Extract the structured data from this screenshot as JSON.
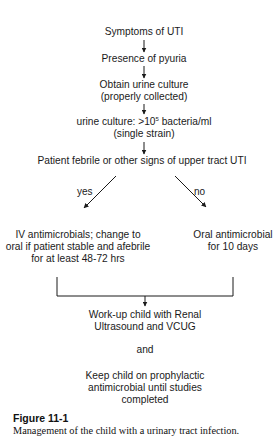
{
  "flowchart": {
    "nodes": {
      "symptoms": [
        "Symptoms of UTI"
      ],
      "pyuria": [
        "Presence of pyuria"
      ],
      "culture": [
        "Obtain urine culture",
        "(properly collected)"
      ],
      "result_prefix": "urine culture: >10",
      "result_exp": "5",
      "result_suffix": " bacteria/ml",
      "result_line2": "(single strain)",
      "febrile": [
        "Patient febrile or other signs of upper tract UTI"
      ],
      "iv": [
        "IV antimicrobials; change to",
        "oral if patient stable and afebrile",
        "for at least 48-72 hrs"
      ],
      "oral": [
        "Oral antimicrobial",
        "for 10 days"
      ],
      "workup": [
        "Work-up child with Renal",
        "Ultrasound and VCUG"
      ],
      "and": [
        "and"
      ],
      "prophylaxis": [
        "Keep child on prophylactic",
        "antimicrobial until studies",
        "completed"
      ]
    },
    "branch_labels": {
      "yes": "yes",
      "no": "no"
    },
    "line_color": "#1a1a1a"
  },
  "figure": {
    "number": "Figure 11-1",
    "caption": "Management of the child with a urinary tract infection."
  }
}
